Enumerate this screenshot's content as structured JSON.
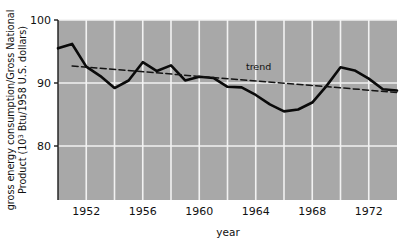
{
  "chart_data": {
    "type": "line",
    "title": "",
    "xlabel": "year",
    "ylabel_line1": "gross energy consumption/Gross National",
    "ylabel_line2_pre": "Product (10",
    "ylabel_line2_sup": "3",
    "ylabel_line2_post": " Btu/1958 U.S. dollars)",
    "xlim": [
      1950,
      1974
    ],
    "ylim": [
      74,
      100
    ],
    "xticks": [
      1952,
      1956,
      1960,
      1964,
      1968,
      1972
    ],
    "xtick_labels": [
      "1952",
      "1956",
      "1960",
      "1964",
      "1968",
      "1972"
    ],
    "gridlines_x": [
      1952,
      1954,
      1956,
      1958,
      1960,
      1962,
      1964,
      1966,
      1968,
      1970,
      1972
    ],
    "yticks": [
      100,
      90,
      80
    ],
    "ytick_labels": [
      "100",
      "90",
      "80"
    ],
    "grid": true,
    "plot_background": "#a8a8a8",
    "grid_color": "#f2f2f2",
    "legend_position": "inline-annotation",
    "series": [
      {
        "name": "gross energy consumption / GNP",
        "style": "solid",
        "color": "#0a0a0a",
        "width": 2.6,
        "x": [
          1950,
          1951,
          1952,
          1953,
          1954,
          1955,
          1956,
          1957,
          1958,
          1959,
          1960,
          1961,
          1962,
          1963,
          1964,
          1965,
          1966,
          1967,
          1968,
          1969,
          1970,
          1971,
          1972,
          1973,
          1974
        ],
        "values": [
          95.5,
          96.2,
          92.6,
          91.1,
          89.2,
          90.4,
          93.3,
          91.9,
          92.8,
          90.4,
          91.0,
          90.8,
          89.4,
          89.3,
          88.1,
          86.6,
          85.5,
          85.8,
          86.9,
          89.5,
          92.5,
          92.0,
          90.7,
          89.0,
          88.8
        ]
      },
      {
        "name": "trend",
        "style": "dashed",
        "color": "#141414",
        "width": 1.5,
        "x": [
          1951,
          1974
        ],
        "values": [
          92.7,
          88.5
        ],
        "annotation": "trend",
        "annotation_x": 1964.2,
        "annotation_y": 92.1
      }
    ]
  },
  "figure": {
    "background": "#ffffff",
    "axis_color": "#1a1a1a"
  }
}
